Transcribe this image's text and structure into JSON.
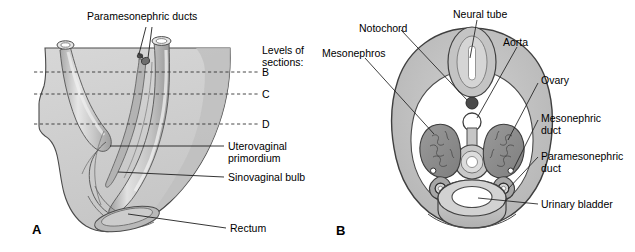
{
  "figure": {
    "type": "anatomical-diagram",
    "title_visible": false,
    "background_color": "#ffffff",
    "panels": [
      {
        "id": "A",
        "letter": "A"
      },
      {
        "id": "B",
        "letter": "B"
      }
    ]
  },
  "colors": {
    "outline": "#3a3a3a",
    "tissue_light": "#d4d4d4",
    "tissue_mid": "#bcbcbc",
    "tissue_dark": "#9a9a9a",
    "tissue_darker": "#7d7d7d",
    "notochord": "#4a4a4a",
    "lumen_white": "#ffffff",
    "leader_line": "#2b2b2b",
    "dashed_line": "#3a3a3a",
    "text": "#000000"
  },
  "panel_a": {
    "letter": "A",
    "labels": {
      "paramesonephric_ducts": "Paramesonephric ducts",
      "levels_of_sections_line1": "Levels of",
      "levels_of_sections_line2": "sections:",
      "section_b": "B",
      "section_c": "C",
      "section_d": "D",
      "uterovaginal_line1": "Uterovaginal",
      "uterovaginal_line2": "primordium",
      "sinovaginal_bulb": "Sinovaginal bulb",
      "rectum": "Rectum"
    },
    "section_levels": [
      {
        "letter": "B",
        "y": 72
      },
      {
        "letter": "C",
        "y": 94
      },
      {
        "letter": "D",
        "y": 124
      }
    ]
  },
  "panel_b": {
    "letter": "B",
    "labels": {
      "neural_tube": "Neural tube",
      "notochord": "Notochord",
      "aorta": "Aorta",
      "mesonephros": "Mesonephros",
      "ovary": "Ovary",
      "mesonephric_duct_line1": "Mesonephric",
      "mesonephric_duct_line2": "duct",
      "paramesonephric_duct_line1": "Paramesonephric",
      "paramesonephric_duct_line2": "duct",
      "urinary_bladder": "Urinary bladder"
    },
    "structures": [
      "neural-tube",
      "notochord",
      "aorta",
      "mesonephros-left",
      "mesonephros-right",
      "ovary-left",
      "ovary-right",
      "mesonephric-duct-left",
      "mesonephric-duct-right",
      "paramesonephric-duct-left",
      "paramesonephric-duct-right",
      "gut-tube",
      "urinary-bladder",
      "body-wall"
    ]
  }
}
